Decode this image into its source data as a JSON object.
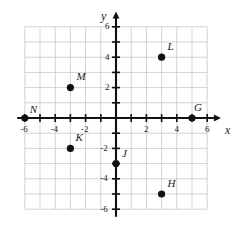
{
  "chart_data": {
    "type": "scatter",
    "title": "",
    "xlabel": "x",
    "ylabel": "y",
    "xlim": [
      -6.6,
      6.6
    ],
    "ylim": [
      -6.6,
      6.6
    ],
    "grid": true,
    "grid_step": 1,
    "legend": "none",
    "x_ticks": [
      -6,
      -5,
      -4,
      -3,
      -2,
      -1,
      1,
      2,
      3,
      4,
      5,
      6
    ],
    "y_ticks": [
      -6,
      -5,
      -4,
      -3,
      -2,
      -1,
      1,
      2,
      3,
      4,
      5,
      6
    ],
    "x_tick_labels": [
      {
        "value": -6,
        "text": "-6"
      },
      {
        "value": -4,
        "text": "-4"
      },
      {
        "value": -2,
        "text": "-2"
      },
      {
        "value": 2,
        "text": "2"
      },
      {
        "value": 4,
        "text": "4"
      },
      {
        "value": 6,
        "text": "6"
      }
    ],
    "y_tick_labels": [
      {
        "value": 6,
        "text": "6"
      },
      {
        "value": 4,
        "text": "4"
      },
      {
        "value": 2,
        "text": "2"
      },
      {
        "value": -2,
        "text": "-2"
      },
      {
        "value": -4,
        "text": "-4"
      },
      {
        "value": -6,
        "text": "-6"
      }
    ],
    "points": [
      {
        "label": "N",
        "x": -6,
        "y": 0,
        "label_dx": 5,
        "label_dy": -14
      },
      {
        "label": "M",
        "x": -3,
        "y": 2,
        "label_dx": 6,
        "label_dy": -17
      },
      {
        "label": "K",
        "x": -3,
        "y": -2,
        "label_dx": 5,
        "label_dy": -16
      },
      {
        "label": "J",
        "x": 0,
        "y": -3,
        "label_dx": 6,
        "label_dy": -16
      },
      {
        "label": "L",
        "x": 3,
        "y": 4,
        "label_dx": 6,
        "label_dy": -16
      },
      {
        "label": "H",
        "x": 3,
        "y": -5,
        "label_dx": 6,
        "label_dy": -16
      },
      {
        "label": "G",
        "x": 5,
        "y": 0,
        "label_dx": 2,
        "label_dy": -16
      }
    ],
    "point_color": "#111111",
    "axis_color": "#111111",
    "grid_color": "#c8c8c8"
  },
  "axis_labels": {
    "x": "x",
    "y": "y"
  }
}
